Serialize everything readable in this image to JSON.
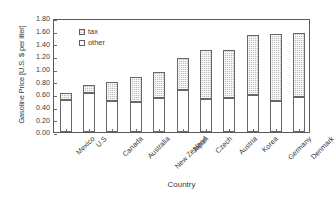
{
  "chart_data": {
    "type": "bar",
    "stacked": true,
    "title": "",
    "xlabel": "Country",
    "ylabel": "Gasoline Price [U.S. $ per liter]",
    "ylim": [
      0.0,
      1.8
    ],
    "ytick_labels": [
      "0.00",
      "0.20",
      "0.40",
      "0.60",
      "0.80",
      "1.00",
      "1.20",
      "1.40",
      "1.60",
      "1.80"
    ],
    "ytick_values": [
      0.0,
      0.2,
      0.4,
      0.6,
      0.8,
      1.0,
      1.2,
      1.4,
      1.6,
      1.8
    ],
    "grid": false,
    "legend_position": "inside-top-left",
    "categories": [
      "Mexico",
      "U.S",
      "Canada",
      "Australia",
      "New Zealand",
      "Japan",
      "Czech",
      "Austria",
      "Korea",
      "Germany",
      "Denmark"
    ],
    "series": [
      {
        "name": "other",
        "color": "#ffffff",
        "values": [
          0.5,
          0.62,
          0.49,
          0.47,
          0.53,
          0.66,
          0.52,
          0.53,
          0.59,
          0.49,
          0.55
        ]
      },
      {
        "name": "tax",
        "color": "#bdbdbd",
        "values": [
          0.12,
          0.13,
          0.3,
          0.4,
          0.42,
          0.51,
          0.77,
          0.77,
          0.94,
          1.06,
          1.01
        ]
      }
    ],
    "totals": [
      0.62,
      0.75,
      0.79,
      0.87,
      0.95,
      1.17,
      1.29,
      1.3,
      1.53,
      1.55,
      1.56
    ]
  },
  "legend": {
    "entries": [
      {
        "label": "tax",
        "swatch": "hatched-gray"
      },
      {
        "label": "other",
        "swatch": "white"
      }
    ]
  }
}
